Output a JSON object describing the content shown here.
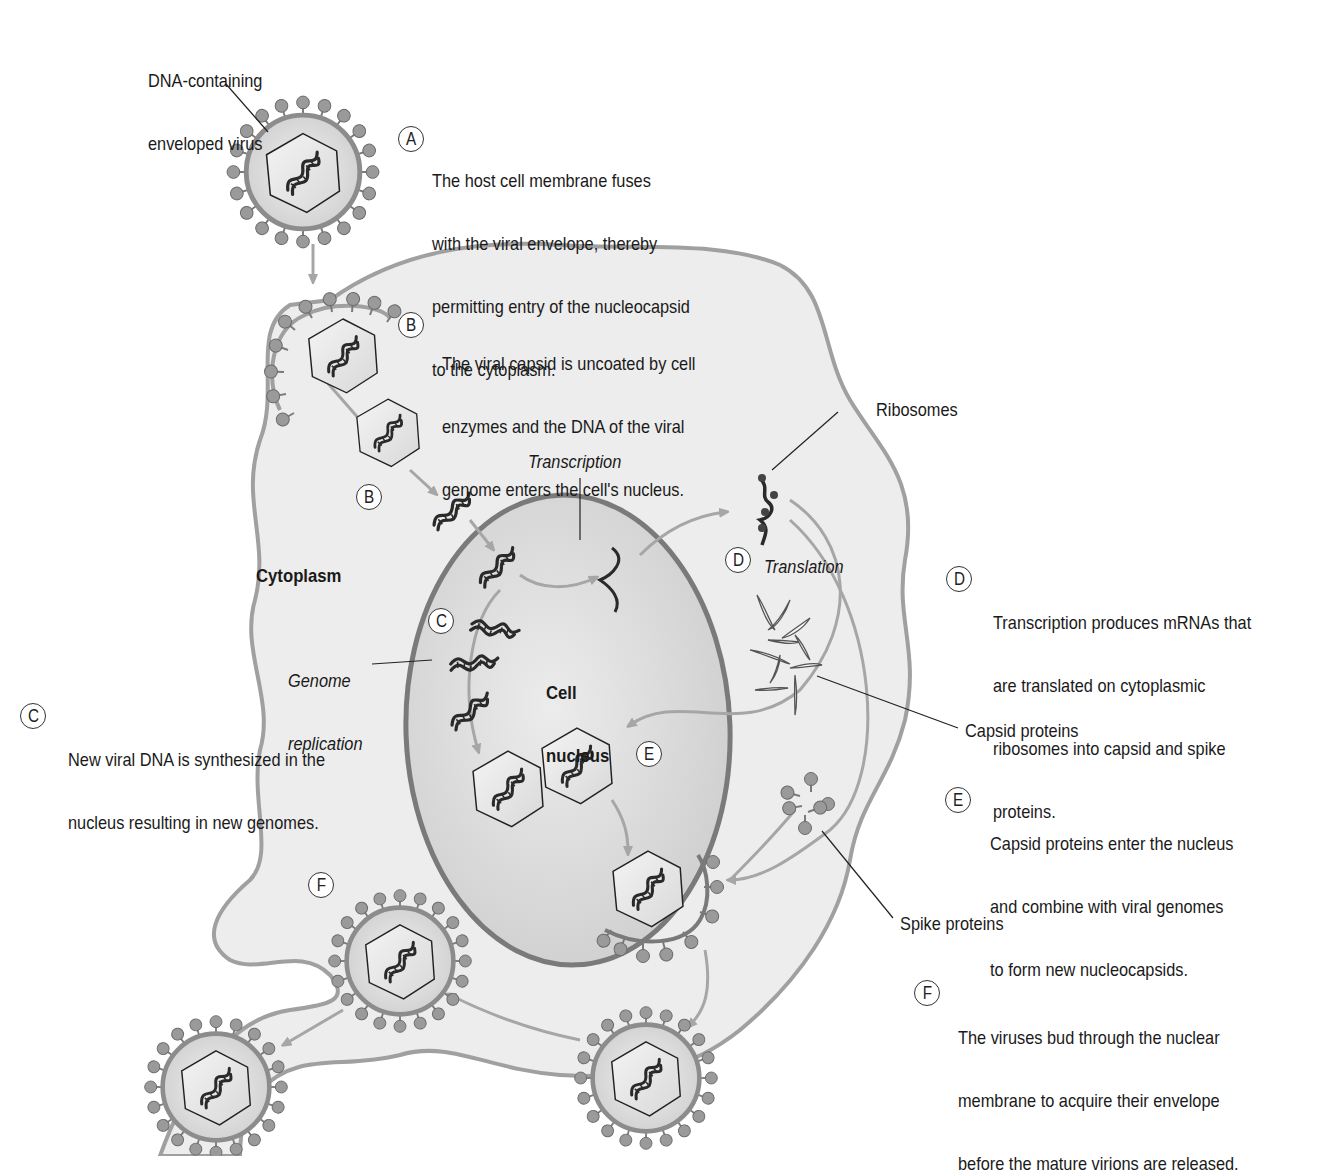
{
  "figure": {
    "title_label": "DNA-containing enveloped virus",
    "title_lines": [
      "DNA-containing",
      "enveloped virus"
    ],
    "colors": {
      "background": "#ffffff",
      "cytoplasm_fill": "#ededed",
      "cell_membrane": "#a0a0a0",
      "nucleus_fill": "#dcdcdc",
      "nucleus_membrane": "#7a7a7a",
      "virion_envelope": "#8c8c8c",
      "virion_fill": "#d6d6d6",
      "spike": "#8e8e8e",
      "arrow": "#a6a6a6",
      "dna": "#2a2a2a"
    }
  },
  "steps": [
    {
      "id": "A",
      "lines": [
        "The host cell membrane fuses",
        "with the viral envelope, thereby",
        "permitting entry of the nucleocapsid",
        "to the cytoplasm."
      ]
    },
    {
      "id": "B",
      "lines": [
        "The viral capsid is uncoated by cell",
        "enzymes and the DNA of the viral",
        "genome enters the cell's nucleus."
      ]
    },
    {
      "id": "C",
      "lines": [
        "New viral DNA is synthesized in the",
        "nucleus resulting in new genomes."
      ]
    },
    {
      "id": "D",
      "lines": [
        "Transcription produces mRNAs that",
        "are translated on cytoplasmic",
        "ribosomes into capsid and spike",
        "proteins."
      ]
    },
    {
      "id": "E",
      "lines": [
        "Capsid proteins enter the nucleus",
        "and combine with viral genomes",
        "to form new nucleocapsids."
      ]
    },
    {
      "id": "F",
      "lines": [
        "The viruses bud through the nuclear",
        "membrane to acquire their envelope",
        "before the mature virions are released."
      ]
    }
  ],
  "markers": {
    "B_inner": "B",
    "C_inner": "C",
    "D_inner": "D",
    "E_inner": "E",
    "F_inner": "F"
  },
  "labels": {
    "cytoplasm": "Cytoplasm",
    "cell_nucleus_lines": [
      "Cell",
      "nucleus"
    ],
    "transcription": "Transcription",
    "translation": "Translation",
    "genome_replication_lines": [
      "Genome",
      "replication"
    ],
    "ribosomes": "Ribosomes",
    "capsid_proteins": "Capsid proteins",
    "spike_proteins": "Spike proteins"
  }
}
